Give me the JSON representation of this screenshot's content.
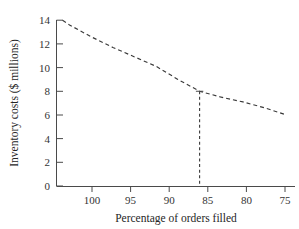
{
  "chart_data": {
    "type": "line",
    "title": "",
    "xlabel": "Percentage of orders filled",
    "ylabel": "Inventory costs ($ millions)",
    "x_tick_labels": [
      "100",
      "95",
      "90",
      "85",
      "80",
      "75"
    ],
    "x_ticks": [
      100,
      95,
      90,
      85,
      80,
      75
    ],
    "y_tick_labels": [
      "0",
      "2",
      "4",
      "6",
      "8",
      "10",
      "12",
      "14"
    ],
    "y_ticks": [
      0,
      2,
      4,
      6,
      8,
      10,
      12,
      14
    ],
    "xlim": [
      101.5,
      74.0
    ],
    "ylim": [
      0,
      14
    ],
    "x_axis_reversed": true,
    "grid": false,
    "legend": null,
    "series": [
      {
        "name": "Inventory costs",
        "style": "dashed",
        "color": "#3a3a3a",
        "x": [
          100.8,
          100,
          97.5,
          95,
          92.5,
          90,
          87.5,
          85,
          82.5,
          80,
          77.5,
          75
        ],
        "y": [
          14.0,
          13.6,
          12.6,
          11.7,
          10.9,
          10.1,
          9.0,
          8.0,
          7.5,
          7.1,
          6.6,
          6.0
        ]
      }
    ],
    "annotations": [
      {
        "name": "drop-line",
        "type": "vertical-dashed-line",
        "x": 85,
        "y_from": 0,
        "y_to": 8,
        "color": "#3a3a3a",
        "description": "Dashed drop line from curve at 85% orders filled down to axis; inventory cost 8"
      }
    ]
  },
  "figure": {
    "background_color": "#ffffff",
    "axis_color": "#4a4a4a",
    "text_color": "#2b2b2b"
  }
}
